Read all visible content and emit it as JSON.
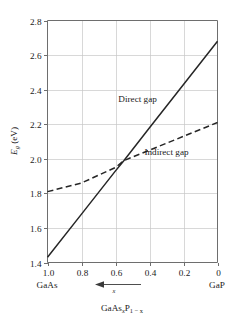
{
  "figure": {
    "name": "band-gap-vs-composition",
    "background_color": "#ffffff",
    "line_color": "#262626",
    "grid_color": "#c8c8c8",
    "axis_color": "#6e6e6e"
  },
  "axes": {
    "y_label_main": "E",
    "y_label_sub": "g",
    "y_label_unit": " (eV)",
    "x_axis_title_parts": {
      "a": "GaAs",
      "a_sub": "x",
      "b": "P",
      "b_sub": "1 − x"
    },
    "x_direction_symbol": "x",
    "left_endpoint_label": "GaAs",
    "right_endpoint_label": "GaP"
  },
  "chart_data": {
    "type": "line",
    "title": "",
    "xlabel": "GaAsxP1−x",
    "ylabel": "Eg (eV)",
    "xlim": [
      1.0,
      0.0
    ],
    "ylim": [
      1.4,
      2.8
    ],
    "x_reversed": true,
    "grid": true,
    "legend": "inline-annotations",
    "xticks": [
      "1.0",
      "0.8",
      "0.6",
      "0.4",
      "0.2",
      "0"
    ],
    "xtick_values": [
      1.0,
      0.8,
      0.6,
      0.4,
      0.2,
      0.0
    ],
    "yticks": [
      "1.4",
      "1.6",
      "1.8",
      "2.0",
      "2.2",
      "2.4",
      "2.6",
      "2.8"
    ],
    "ytick_values": [
      1.4,
      1.6,
      1.8,
      2.0,
      2.2,
      2.4,
      2.6,
      2.8
    ],
    "series": [
      {
        "name": "Direct gap",
        "style": "solid",
        "x": [
          1.0,
          0.8,
          0.6,
          0.55,
          0.4,
          0.2,
          0.0
        ],
        "values": [
          1.43,
          1.68,
          1.93,
          1.99,
          2.18,
          2.43,
          2.68
        ]
      },
      {
        "name": "Indirect gap",
        "style": "dashed",
        "x": [
          1.0,
          0.8,
          0.6,
          0.55,
          0.4,
          0.2,
          0.0
        ],
        "values": [
          1.81,
          1.86,
          1.95,
          1.99,
          2.05,
          2.13,
          2.21
        ]
      }
    ],
    "annotations": [
      {
        "text": "Direct gap",
        "x": 0.47,
        "y": 2.33
      },
      {
        "text": "Indirect gap",
        "x": 0.3,
        "y": 2.02
      }
    ]
  }
}
